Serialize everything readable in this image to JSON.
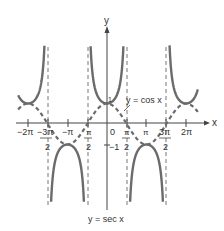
{
  "chart_data": {
    "type": "line",
    "title": "",
    "caption": "y = sec x",
    "xlabel": "x",
    "ylabel": "y",
    "xlim": [
      -6.9,
      7.2
    ],
    "ylim": [
      -4.0,
      3.9
    ],
    "grid": false,
    "x_ticks": [
      "−2π",
      "−3π/2",
      "−π",
      "−π/2",
      "0",
      "π/2",
      "π",
      "3π/2",
      "2π"
    ],
    "x_tick_values": [
      -6.2832,
      -4.7124,
      -3.1416,
      -1.5708,
      0,
      1.5708,
      3.1416,
      4.7124,
      6.2832
    ],
    "y_ticks": [
      "1",
      "−1"
    ],
    "y_tick_values": [
      1,
      -1
    ],
    "series": [
      {
        "name": "y = sec x",
        "style": "solid",
        "color": "#6b6b6b",
        "formula": "1/cos(x)"
      },
      {
        "name": "y = cos x",
        "style": "dashed",
        "color": "#6b6b6b",
        "formula": "cos(x)"
      }
    ],
    "asymptotes": [
      -4.7124,
      -1.5708,
      1.5708,
      4.7124
    ],
    "annotations": [
      {
        "text": "y = cos x",
        "pointing_to": "cos curve near x = π/2"
      },
      {
        "text": "y = sec x",
        "position": "below graph"
      }
    ]
  },
  "labels": {
    "x_axis": "x",
    "y_axis": "y",
    "origin": "0",
    "y_one": "1",
    "y_neg_one": "−1",
    "cos_label": "y = cos x",
    "sec_label": "y = sec x",
    "ticks": {
      "neg_2pi": "−2π",
      "neg_3pi_2_num": "−3π",
      "neg_3pi_2_den": "2",
      "neg_pi": "−π",
      "neg_pi_2_num": "π",
      "neg_pi_2_den": "2",
      "pi_2_num": "π",
      "pi_2_den": "2",
      "pi": "π",
      "three_pi_2_num": "3π",
      "three_pi_2_den": "2",
      "two_pi": "2π"
    }
  }
}
